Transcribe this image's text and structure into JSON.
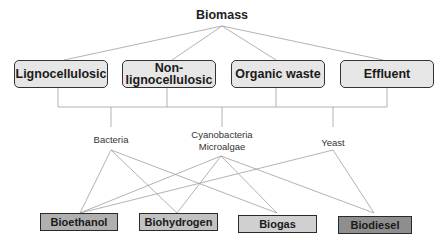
{
  "diagram": {
    "root": {
      "label": "Biomass"
    },
    "sources": [
      {
        "label": "Lignocellulosic"
      },
      {
        "label": "Non-lignocellulosic"
      },
      {
        "label": "Organic waste"
      },
      {
        "label": "Effluent"
      }
    ],
    "organisms": [
      {
        "label": "Bacteria"
      },
      {
        "label": "Cyanobacteria\nMicroalgae",
        "line1": "Cyanobacteria",
        "line2": "Microalgae"
      },
      {
        "label": "Yeast"
      }
    ],
    "products": [
      {
        "label": "Bioethanol",
        "fill": "#b0b0b0"
      },
      {
        "label": "Biohydrogen",
        "fill": "#c2c2c2"
      },
      {
        "label": "Biogas",
        "fill": "#d0d0d0"
      },
      {
        "label": "Biodiesel",
        "fill": "#8e8e8e"
      }
    ],
    "edges": [
      {
        "from": "Biomass",
        "to": "Lignocellulosic"
      },
      {
        "from": "Biomass",
        "to": "Non-lignocellulosic"
      },
      {
        "from": "Biomass",
        "to": "Organic waste"
      },
      {
        "from": "Biomass",
        "to": "Effluent"
      },
      {
        "from": "Sources",
        "to": "Bacteria"
      },
      {
        "from": "Sources",
        "to": "Cyanobacteria Microalgae"
      },
      {
        "from": "Sources",
        "to": "Yeast"
      },
      {
        "from": "Bacteria",
        "to": "Bioethanol"
      },
      {
        "from": "Bacteria",
        "to": "Biohydrogen"
      },
      {
        "from": "Bacteria",
        "to": "Biogas"
      },
      {
        "from": "Cyanobacteria Microalgae",
        "to": "Bioethanol"
      },
      {
        "from": "Cyanobacteria Microalgae",
        "to": "Biohydrogen"
      },
      {
        "from": "Cyanobacteria Microalgae",
        "to": "Biogas"
      },
      {
        "from": "Cyanobacteria Microalgae",
        "to": "Biodiesel"
      },
      {
        "from": "Yeast",
        "to": "Bioethanol"
      },
      {
        "from": "Yeast",
        "to": "Biodiesel"
      }
    ],
    "colors": {
      "line": "#9a9a9a",
      "source_fill": "#e6e6e6",
      "border": "#333333"
    }
  }
}
